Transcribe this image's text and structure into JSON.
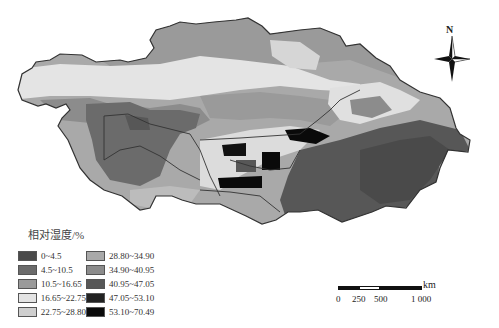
{
  "map": {
    "title": "相对湿度/%",
    "region": "Central Asia",
    "north_label": "N"
  },
  "legend": {
    "title": "相对湿度/%",
    "items": [
      {
        "label": "0~4.5",
        "color": "#4a4a4a"
      },
      {
        "label": "4.5~10.5",
        "color": "#6b6b6b"
      },
      {
        "label": "10.5~16.65",
        "color": "#9a9a9a"
      },
      {
        "label": "16.65~22.75",
        "color": "#e4e4e4"
      },
      {
        "label": "22.75~28.80",
        "color": "#cfcfcf"
      },
      {
        "label": "28.80~34.90",
        "color": "#a9a9a9"
      },
      {
        "label": "34.90~40.95",
        "color": "#8c8c8c"
      },
      {
        "label": "40.95~47.05",
        "color": "#575757"
      },
      {
        "label": "47.05~53.10",
        "color": "#222222"
      },
      {
        "label": "53.10~70.49",
        "color": "#0a0a0a"
      }
    ]
  },
  "scale_bar": {
    "unit": "km",
    "ticks": [
      "0",
      "250",
      "500",
      "1 000"
    ]
  },
  "colors": {
    "border": "#333333",
    "background": "#ffffff"
  }
}
